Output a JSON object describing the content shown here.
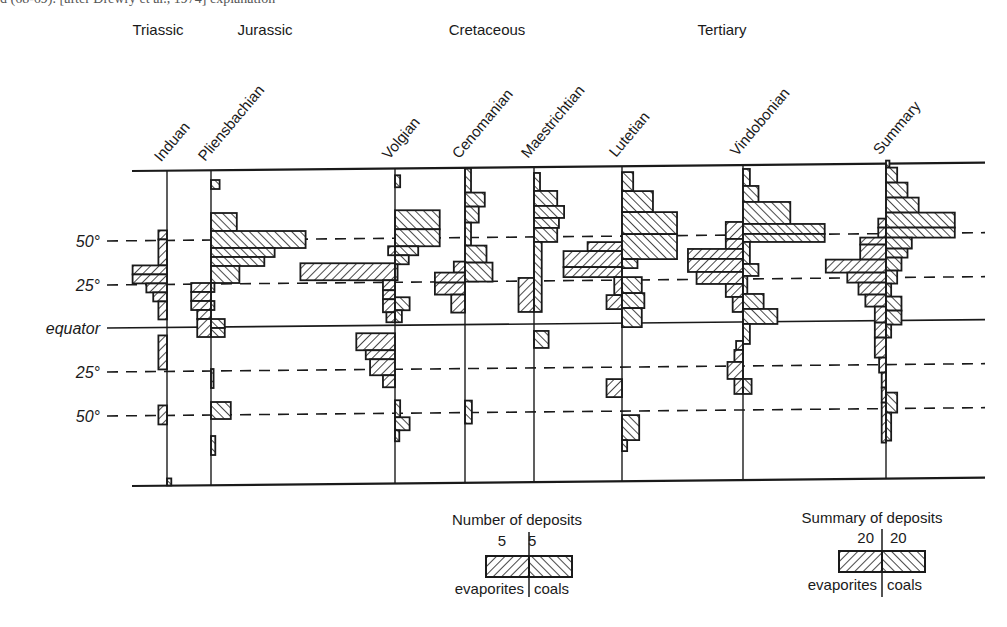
{
  "caption_fragment": "d (68-69). [after Drewry et al., 1974] explanation",
  "periods": [
    {
      "label": "Triassic",
      "x": 158,
      "y": 22
    },
    {
      "label": "Jurassic",
      "x": 265,
      "y": 22
    },
    {
      "label": "Cretaceous",
      "x": 487,
      "y": 22
    },
    {
      "label": "Tertiary",
      "x": 722,
      "y": 22
    }
  ],
  "latitude_labels": [
    {
      "label": "50°",
      "y": 241,
      "line": "dashed"
    },
    {
      "label": "25°",
      "y": 285,
      "line": "dashed"
    },
    {
      "label": "equator",
      "y": 328,
      "line": "solid"
    },
    {
      "label": "25°",
      "y": 372,
      "line": "dashed"
    },
    {
      "label": "50°",
      "y": 416,
      "line": "dashed"
    }
  ],
  "frame": {
    "top_y": 171,
    "bottom_y": 486,
    "left_x": 107,
    "right_x": 985,
    "slope": -0.0095
  },
  "colors": {
    "ink": "#1a1a1a",
    "background": "#ffffff"
  },
  "legend_stage": {
    "title": "Number of deposits",
    "left_value": "5",
    "right_value": "5",
    "left_label": "evaporites",
    "right_label": "coals"
  },
  "legend_summary": {
    "title": "Summary of deposits",
    "left_value": "20",
    "right_value": "20",
    "left_label": "evaporites",
    "right_label": "coals"
  },
  "chart_data": {
    "type": "bar",
    "xlabel": "Number of deposits (evaporites left, coals right)",
    "ylabel": "Palaeolatitude",
    "y_ticks": [
      "50°N",
      "25°N",
      "equator",
      "25°S",
      "50°S"
    ],
    "legend": [
      "evaporites (left, back-hatched)",
      "coals (right, forward-hatched)"
    ],
    "scale": {
      "stage_px_per_deposit": 8.6,
      "summary_px_per_deposit": 2.15
    },
    "bin_height_px": 9,
    "columns": [
      {
        "name": "Induan",
        "period": "Triassic",
        "axis_x": 167,
        "evaporites": [
          [
            231,
            240,
            1
          ],
          [
            240,
            266,
            1
          ],
          [
            266,
            275,
            4
          ],
          [
            275,
            284,
            4
          ],
          [
            284,
            293,
            2.4
          ],
          [
            293,
            302,
            1.6
          ],
          [
            302,
            320,
            1
          ],
          [
            336,
            370,
            1
          ],
          [
            406,
            425,
            1
          ],
          [
            479,
            486,
            0
          ]
        ],
        "coals": [
          [
            479,
            486,
            0.5
          ]
        ]
      },
      {
        "name": "Pliensbachian",
        "period": "Jurassic",
        "axis_x": 211,
        "evaporites": [
          [
            284,
            293,
            2.3
          ],
          [
            293,
            302,
            2.3
          ],
          [
            302,
            311,
            2.3
          ],
          [
            311,
            320,
            1.6
          ],
          [
            320,
            338,
            1.6
          ]
        ],
        "coals": [
          [
            181,
            190,
            1
          ],
          [
            214,
            232,
            3
          ],
          [
            232,
            249,
            11
          ],
          [
            249,
            258,
            7.4
          ],
          [
            258,
            267,
            6.2
          ],
          [
            267,
            284,
            3.3
          ],
          [
            284,
            293,
            0.4
          ],
          [
            302,
            311,
            0.4
          ],
          [
            320,
            329,
            1.6
          ],
          [
            329,
            338,
            1.6
          ],
          [
            370,
            389,
            0.3
          ],
          [
            403,
            420,
            2.3
          ],
          [
            437,
            456,
            0.5
          ]
        ]
      },
      {
        "name": "Volgian",
        "period": "Jurassic",
        "axis_x": 395,
        "evaporites": [
          [
            249,
            258,
            0.8
          ],
          [
            266,
            283,
            11
          ],
          [
            283,
            293,
            1.4
          ],
          [
            293,
            302,
            1.4
          ],
          [
            302,
            315,
            1.4
          ],
          [
            315,
            325,
            1
          ],
          [
            336,
            353,
            4.5
          ],
          [
            353,
            362,
            3.4
          ],
          [
            362,
            378,
            2.9
          ],
          [
            378,
            390,
            1.4
          ]
        ],
        "coals": [
          [
            178,
            190,
            0.6
          ],
          [
            213,
            232,
            5.2
          ],
          [
            232,
            249,
            5.2
          ],
          [
            249,
            258,
            2.7
          ],
          [
            258,
            267,
            1.6
          ],
          [
            267,
            283,
            0.3
          ],
          [
            300,
            313,
            1.7
          ],
          [
            313,
            325,
            0.8
          ],
          [
            403,
            420,
            0.6
          ],
          [
            420,
            433,
            1.7
          ],
          [
            433,
            444,
            0.5
          ]
        ]
      },
      {
        "name": "Cenomanian",
        "period": "Cretaceous",
        "axis_x": 465,
        "evaporites": [
          [
            265,
            276,
            1.3
          ],
          [
            276,
            286,
            3.5
          ],
          [
            286,
            298,
            3.5
          ],
          [
            298,
            316,
            1.6
          ]
        ],
        "coals": [
          [
            172,
            196,
            0.7
          ],
          [
            196,
            210,
            2.3
          ],
          [
            210,
            226,
            1.6
          ],
          [
            226,
            249,
            0.7
          ],
          [
            249,
            266,
            2.5
          ],
          [
            266,
            285,
            3.2
          ],
          [
            404,
            427,
            0.8
          ]
        ]
      },
      {
        "name": "Maestrichtian",
        "period": "Cretaceous",
        "axis_x": 534,
        "evaporites": [
          [
            282,
            316,
            1.8
          ]
        ],
        "coals": [
          [
            177,
            195,
            0.7
          ],
          [
            195,
            210,
            2.7
          ],
          [
            210,
            222,
            3.5
          ],
          [
            222,
            232,
            2.9
          ],
          [
            232,
            246,
            2.7
          ],
          [
            246,
            316,
            0.9
          ],
          [
            335,
            352,
            1.7
          ]
        ]
      },
      {
        "name": "Lutetian",
        "period": "Cretaceous / Tertiary",
        "axis_x": 622,
        "evaporites": [
          [
            247,
            256,
            4
          ],
          [
            256,
            272,
            6.8
          ],
          [
            272,
            282,
            6.8
          ],
          [
            282,
            300,
            0.9
          ],
          [
            300,
            314,
            1.8
          ],
          [
            384,
            402,
            1.8
          ]
        ],
        "coals": [
          [
            177,
            196,
            1.3
          ],
          [
            196,
            217,
            3.6
          ],
          [
            217,
            239,
            6.4
          ],
          [
            239,
            264,
            6.4
          ],
          [
            264,
            273,
            1.8
          ],
          [
            282,
            298,
            2.3
          ],
          [
            298,
            313,
            2.6
          ],
          [
            313,
            332,
            2.3
          ],
          [
            420,
            445,
            2
          ],
          [
            445,
            456,
            0.6
          ]
        ]
      },
      {
        "name": "Vindobonian",
        "period": "Tertiary",
        "axis_x": 743,
        "evaporites": [
          [
            228,
            245,
            2
          ],
          [
            245,
            255,
            2
          ],
          [
            255,
            265,
            6.4
          ],
          [
            265,
            278,
            6.4
          ],
          [
            278,
            290,
            5.4
          ],
          [
            290,
            303,
            2
          ],
          [
            303,
            318,
            1.2
          ],
          [
            347,
            356,
            0.8
          ],
          [
            356,
            368,
            1
          ],
          [
            368,
            385,
            1.8
          ],
          [
            385,
            400,
            1
          ]
        ],
        "coals": [
          [
            175,
            192,
            0.8
          ],
          [
            192,
            208,
            1.8
          ],
          [
            208,
            230,
            5.5
          ],
          [
            230,
            240,
            9.5
          ],
          [
            240,
            248,
            9.5
          ],
          [
            248,
            270,
            0.8
          ],
          [
            270,
            282,
            1.8
          ],
          [
            282,
            300,
            0.5
          ],
          [
            300,
            315,
            2.4
          ],
          [
            315,
            330,
            4
          ],
          [
            330,
            350,
            0.8
          ],
          [
            385,
            400,
            1
          ]
        ]
      },
      {
        "name": "Summary",
        "period": "Tertiary",
        "axis_x": 886,
        "evaporites": [
          [
            226,
            235,
            0.9
          ],
          [
            235,
            245,
            0.9
          ],
          [
            245,
            252,
            3
          ],
          [
            252,
            267,
            3
          ],
          [
            267,
            280,
            7
          ],
          [
            280,
            290,
            4.5
          ],
          [
            290,
            302,
            3.2
          ],
          [
            302,
            314,
            2.4
          ],
          [
            314,
            330,
            1.3
          ],
          [
            330,
            345,
            1.3
          ],
          [
            345,
            365,
            1.3
          ],
          [
            365,
            380,
            0.8
          ],
          [
            380,
            395,
            0.5
          ],
          [
            395,
            410,
            0.5
          ],
          [
            410,
            450,
            0.5
          ]
        ],
        "coals": [
          [
            168,
            175,
            0.4
          ],
          [
            175,
            190,
            1.3
          ],
          [
            190,
            205,
            2.5
          ],
          [
            205,
            220,
            3.8
          ],
          [
            220,
            235,
            8
          ],
          [
            235,
            245,
            8
          ],
          [
            245,
            256,
            3
          ],
          [
            256,
            265,
            2.5
          ],
          [
            265,
            278,
            1.8
          ],
          [
            278,
            291,
            1.3
          ],
          [
            291,
            304,
            0.6
          ],
          [
            304,
            318,
            1.8
          ],
          [
            318,
            332,
            1.8
          ],
          [
            332,
            345,
            0.6
          ],
          [
            400,
            420,
            1.3
          ],
          [
            420,
            448,
            0.6
          ]
        ]
      }
    ]
  }
}
